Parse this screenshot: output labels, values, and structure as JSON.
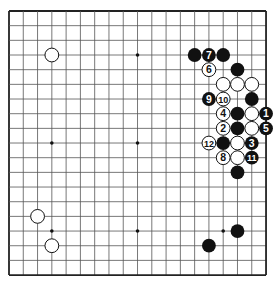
{
  "board": {
    "size": 19,
    "origin": {
      "x": 9,
      "y": 11
    },
    "spacing": {
      "x": 14.28,
      "y": 14.67
    },
    "colors": {
      "line": "#555555",
      "border": "#222222",
      "black": "#111111",
      "white": "#ffffff",
      "background": "#ffffff"
    }
  },
  "star_points": [
    [
      3,
      3
    ],
    [
      9,
      3
    ],
    [
      15,
      3
    ],
    [
      3,
      9
    ],
    [
      9,
      9
    ],
    [
      15,
      9
    ],
    [
      3,
      15
    ],
    [
      9,
      15
    ],
    [
      15,
      15
    ]
  ],
  "stones": [
    {
      "col": 3,
      "row": 3,
      "color": "white",
      "label": ""
    },
    {
      "col": 13,
      "row": 3,
      "color": "black",
      "label": ""
    },
    {
      "col": 14,
      "row": 3,
      "color": "black",
      "label": "7"
    },
    {
      "col": 15,
      "row": 3,
      "color": "black",
      "label": ""
    },
    {
      "col": 14,
      "row": 4,
      "color": "white",
      "label": "6"
    },
    {
      "col": 16,
      "row": 4,
      "color": "black",
      "label": ""
    },
    {
      "col": 15,
      "row": 5,
      "color": "white",
      "label": ""
    },
    {
      "col": 16,
      "row": 5,
      "color": "white",
      "label": ""
    },
    {
      "col": 17,
      "row": 5,
      "color": "white",
      "label": ""
    },
    {
      "col": 14,
      "row": 6,
      "color": "black",
      "label": "9"
    },
    {
      "col": 15,
      "row": 6,
      "color": "white",
      "label": "10"
    },
    {
      "col": 17,
      "row": 6,
      "color": "black",
      "label": ""
    },
    {
      "col": 15,
      "row": 7,
      "color": "white",
      "label": "4"
    },
    {
      "col": 16,
      "row": 7,
      "color": "black",
      "label": ""
    },
    {
      "col": 17,
      "row": 7,
      "color": "white",
      "label": ""
    },
    {
      "col": 18,
      "row": 7,
      "color": "black",
      "label": "1"
    },
    {
      "col": 15,
      "row": 8,
      "color": "white",
      "label": "2"
    },
    {
      "col": 16,
      "row": 8,
      "color": "black",
      "label": ""
    },
    {
      "col": 17,
      "row": 8,
      "color": "white",
      "label": ""
    },
    {
      "col": 18,
      "row": 8,
      "color": "black",
      "label": "5"
    },
    {
      "col": 14,
      "row": 9,
      "color": "white",
      "label": "12"
    },
    {
      "col": 15,
      "row": 9,
      "color": "black",
      "label": ""
    },
    {
      "col": 16,
      "row": 9,
      "color": "white",
      "label": ""
    },
    {
      "col": 17,
      "row": 9,
      "color": "black",
      "label": "3"
    },
    {
      "col": 15,
      "row": 10,
      "color": "white",
      "label": "8"
    },
    {
      "col": 16,
      "row": 10,
      "color": "white",
      "label": ""
    },
    {
      "col": 17,
      "row": 10,
      "color": "black",
      "label": "11"
    },
    {
      "col": 16,
      "row": 11,
      "color": "black",
      "label": ""
    },
    {
      "col": 2,
      "row": 14,
      "color": "white",
      "label": ""
    },
    {
      "col": 3,
      "row": 16,
      "color": "white",
      "label": ""
    },
    {
      "col": 16,
      "row": 15,
      "color": "black",
      "label": ""
    },
    {
      "col": 14,
      "row": 16,
      "color": "black",
      "label": ""
    }
  ]
}
